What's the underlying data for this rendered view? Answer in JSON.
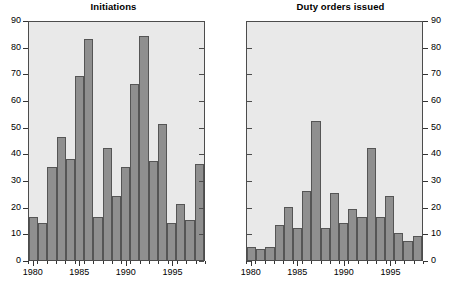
{
  "figure": {
    "background": "#ffffff",
    "plot_background": "#e9e9e9",
    "bar_fill": "#8f8f8f",
    "bar_edge": "#555555",
    "axis_color": "#333333"
  },
  "panels": [
    {
      "title": "Initiations"
    },
    {
      "title": "Duty orders issued"
    }
  ],
  "chart_data": [
    {
      "type": "bar",
      "title": "Initiations",
      "xlabel": "",
      "ylabel": "",
      "ylim": [
        0,
        90
      ],
      "yticks": [
        0,
        10,
        20,
        30,
        40,
        50,
        60,
        70,
        80,
        90
      ],
      "ytick_labels": [
        "0",
        "10",
        "20",
        "30",
        "40",
        "50",
        "60",
        "70",
        "80",
        "90"
      ],
      "y_axis_side": "left",
      "grid": false,
      "legend": "none",
      "categories": [
        1980,
        1981,
        1982,
        1983,
        1984,
        1985,
        1986,
        1987,
        1988,
        1989,
        1990,
        1991,
        1992,
        1993,
        1994,
        1995,
        1996,
        1997,
        1998
      ],
      "xtick_values": [
        1980,
        1985,
        1990,
        1995
      ],
      "xtick_labels": [
        "1980",
        "1985",
        "1990",
        "1995"
      ],
      "values": [
        16,
        14,
        35,
        46,
        38,
        69,
        83,
        16,
        42,
        24,
        35,
        66,
        84,
        37,
        51,
        14,
        21,
        15,
        36
      ]
    },
    {
      "type": "bar",
      "title": "Duty orders issued",
      "xlabel": "",
      "ylabel": "",
      "ylim": [
        0,
        90
      ],
      "yticks": [
        0,
        10,
        20,
        30,
        40,
        50,
        60,
        70,
        80,
        90
      ],
      "ytick_labels": [
        "0",
        "10",
        "20",
        "30",
        "40",
        "50",
        "60",
        "70",
        "80",
        "90"
      ],
      "y_axis_side": "right",
      "grid": false,
      "legend": "none",
      "categories": [
        1980,
        1981,
        1982,
        1983,
        1984,
        1985,
        1986,
        1987,
        1988,
        1989,
        1990,
        1991,
        1992,
        1993,
        1994,
        1995,
        1996,
        1997,
        1998
      ],
      "xtick_values": [
        1980,
        1985,
        1990,
        1995
      ],
      "xtick_labels": [
        "1980",
        "1985",
        "1990",
        "1995"
      ],
      "values": [
        5,
        4,
        5,
        13,
        20,
        12,
        26,
        52,
        12,
        25,
        14,
        19,
        16,
        42,
        16,
        24,
        10,
        7,
        9
      ]
    }
  ]
}
